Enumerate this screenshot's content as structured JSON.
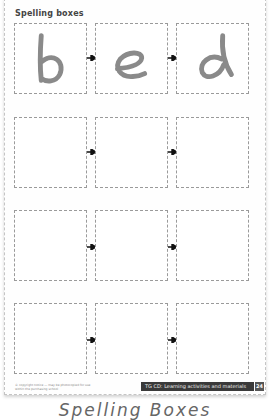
{
  "worksheet": {
    "title": "Spelling boxes",
    "rows": [
      {
        "letters": [
          "b",
          "e",
          "d"
        ]
      },
      {
        "letters": [
          "",
          "",
          ""
        ]
      },
      {
        "letters": [
          "",
          "",
          ""
        ]
      },
      {
        "letters": [
          "",
          "",
          ""
        ]
      }
    ],
    "fine_print": "© copyright notice — may be photocopied for use within the purchasing school",
    "footer_label": "TG CD: Learning activities and materials",
    "page_number": "24",
    "colors": {
      "box_border": "#9a9a9a",
      "letter": "#8a8a8a",
      "footer_bg": "#3a3a3a"
    }
  },
  "caption": "Spelling Boxes"
}
